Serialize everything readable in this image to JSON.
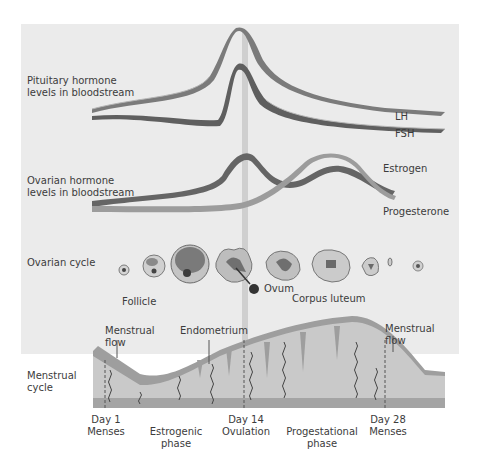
{
  "rows": {
    "pituitary": "Pituitary hormone levels in bloodstream",
    "pituitary_line1": "Pituitary hormone",
    "pituitary_line2": "levels in bloodstream",
    "ovarian_hormone_line1": "Ovarian hormone",
    "ovarian_hormone_line2": "levels in bloodstream",
    "ovarian_cycle": "Ovarian cycle",
    "menstrual_line1": "Menstrual",
    "menstrual_line2": "cycle"
  },
  "curves": {
    "lh": "LH",
    "fsh": "FSH",
    "estrogen": "Estrogen",
    "progesterone": "Progesterone"
  },
  "ovarian_labels": {
    "follicle": "Follicle",
    "ovum": "Ovum",
    "corpus_luteum": "Corpus luteum"
  },
  "menstrual_labels": {
    "flow_left_1": "Menstrual",
    "flow_left_2": "flow",
    "endometrium": "Endometrium",
    "flow_right_1": "Menstrual",
    "flow_right_2": "flow"
  },
  "timeline": {
    "day1": "Day 1",
    "day1_sub": "Menses",
    "estrogenic_1": "Estrogenic",
    "estrogenic_2": "phase",
    "day14": "Day 14",
    "day14_sub": "Ovulation",
    "progestational_1": "Progestational",
    "progestational_2": "phase",
    "day28": "Day 28",
    "day28_sub": "Menses"
  },
  "colors": {
    "panel": "#ebebeb",
    "ribbon_dark": "#6e6e6e",
    "ribbon_light": "#9a9a9a",
    "ovulation_bar": "#c8c8c8",
    "endometrium_fill": "#c9c9c9",
    "endometrium_top": "#9d9d9d",
    "base_band": "#a6a6a6"
  }
}
